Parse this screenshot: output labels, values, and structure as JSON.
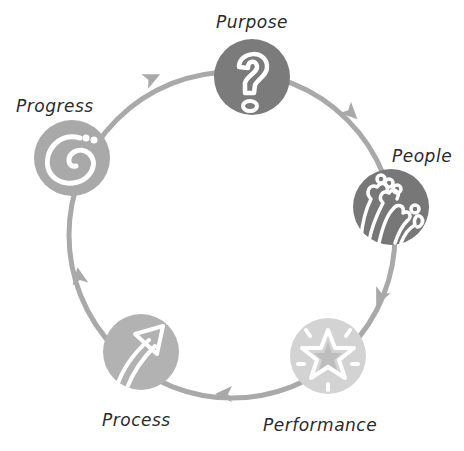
{
  "diagram": {
    "type": "cycle",
    "direction": "clockwise",
    "ring": {
      "cx": 232,
      "cy": 235,
      "r": 163,
      "color": "#a9a9a9",
      "width": 5
    },
    "nodes": [
      {
        "id": "purpose",
        "label": "Purpose",
        "icon": "question-mark-icon",
        "cx": 252,
        "cy": 77,
        "r": 38,
        "color": "#7b7b7b",
        "label_x": 216,
        "label_y": 12
      },
      {
        "id": "people",
        "label": "People",
        "icon": "people-group-icon",
        "cx": 391,
        "cy": 207,
        "r": 38,
        "color": "#777777",
        "label_x": 392,
        "label_y": 146
      },
      {
        "id": "performance",
        "label": "Performance",
        "icon": "star-icon",
        "cx": 328,
        "cy": 356,
        "r": 38,
        "color": "#d3d3d3",
        "label_x": 263,
        "label_y": 415
      },
      {
        "id": "process",
        "label": "Process",
        "icon": "arrow-up-right-icon",
        "cx": 141,
        "cy": 352,
        "r": 38,
        "color": "#b2b2b2",
        "label_x": 102,
        "label_y": 410
      },
      {
        "id": "progress",
        "label": "Progress",
        "icon": "spiral-icon",
        "cx": 72,
        "cy": 158,
        "r": 38,
        "color": "#a9a9a9",
        "label_x": 16,
        "label_y": 96
      }
    ],
    "arrows": [
      {
        "between": "progress-purpose",
        "x": 152,
        "y": 78,
        "angle": -25
      },
      {
        "between": "purpose-people",
        "x": 351,
        "y": 113,
        "angle": 45
      },
      {
        "between": "people-performance",
        "x": 380,
        "y": 297,
        "angle": 115
      },
      {
        "between": "performance-process",
        "x": 224,
        "y": 394,
        "angle": 180
      },
      {
        "between": "process-progress",
        "x": 79,
        "y": 276,
        "angle": -100
      }
    ]
  }
}
